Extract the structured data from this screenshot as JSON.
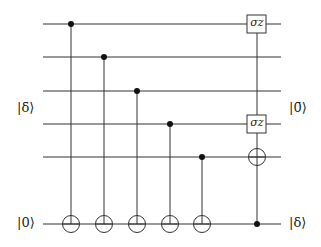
{
  "diagram": {
    "type": "quantum-circuit",
    "labels": {
      "input_upper": "|δ̄⟩",
      "input_ancilla": "|0⟩",
      "output_upper": "|0̄⟩",
      "output_ancilla": "|δ⟩"
    },
    "gates": {
      "sigma_z_top": "σz",
      "sigma_z_mid": "σz"
    },
    "wires": [
      {
        "y": 24
      },
      {
        "y": 57
      },
      {
        "y": 91
      },
      {
        "y": 124
      },
      {
        "y": 157
      },
      {
        "y": 224
      }
    ],
    "cnots": [
      {
        "control_wire": 1,
        "target_wire": 6,
        "x": 71
      },
      {
        "control_wire": 2,
        "target_wire": 6,
        "x": 104
      },
      {
        "control_wire": 3,
        "target_wire": 6,
        "x": 137
      },
      {
        "control_wire": 4,
        "target_wire": 6,
        "x": 170
      },
      {
        "control_wire": 5,
        "target_wire": 6,
        "x": 202
      }
    ],
    "final_operation": {
      "control_wire": 6,
      "x": 257,
      "targets": [
        "σz on wire 1",
        "σz on wire 4",
        "X on wire 5"
      ]
    }
  }
}
